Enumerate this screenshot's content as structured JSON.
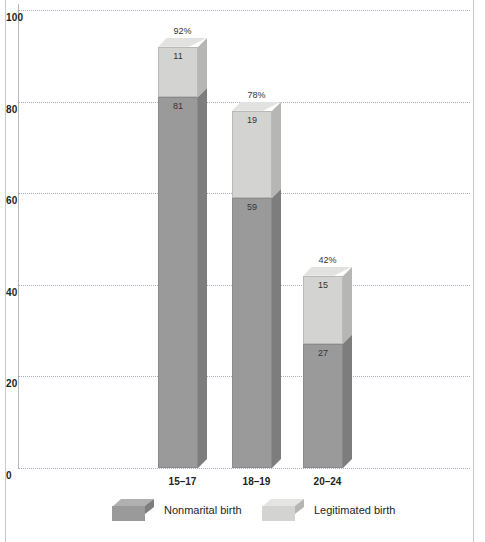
{
  "chart_data": {
    "type": "bar",
    "subtype": "stacked-3d-column",
    "title": "",
    "xlabel": "",
    "ylabel": "",
    "ylim": [
      0,
      100
    ],
    "yticks": [
      "0",
      "20",
      "40",
      "60",
      "80",
      "100"
    ],
    "grid": true,
    "legend_position": "bottom",
    "categories": [
      "15–17",
      "18–19",
      "20–24"
    ],
    "series": [
      {
        "name": "Nonmarital birth",
        "color": "#9a9a9a",
        "values": [
          81,
          59,
          27
        ]
      },
      {
        "name": "Legitimated birth",
        "color": "#d3d3d1",
        "values": [
          11,
          19,
          15
        ]
      }
    ],
    "totals": [
      "92%",
      "78%",
      "42%"
    ],
    "bars": [
      {
        "category": "15–17",
        "total_label": "92%",
        "total_value": 92,
        "dark_value": 81,
        "dark_label": "81",
        "light_value": 11,
        "light_label": "11"
      },
      {
        "category": "18–19",
        "total_label": "78%",
        "total_value": 78,
        "dark_value": 59,
        "dark_label": "59",
        "light_value": 19,
        "light_label": "19"
      },
      {
        "category": "20–24",
        "total_label": "42%",
        "total_value": 42,
        "dark_value": 27,
        "dark_label": "27",
        "light_value": 15,
        "light_label": "15"
      }
    ]
  },
  "axis": {
    "y": {
      "ticks": [
        {
          "label": "100",
          "value": 100
        },
        {
          "label": "80",
          "value": 80
        },
        {
          "label": "60",
          "value": 60
        },
        {
          "label": "40",
          "value": 40
        },
        {
          "label": "20",
          "value": 20
        },
        {
          "label": "0",
          "value": 0
        }
      ]
    }
  },
  "legend": {
    "items": [
      {
        "label": "Nonmarital birth",
        "swatch": "dark-gray-cube"
      },
      {
        "label": "Legitimated birth",
        "swatch": "light-gray-cube"
      }
    ]
  },
  "colors": {
    "dark_front": "#9a9a9a",
    "dark_side": "#7d7d7d",
    "dark_top": "#adadad",
    "light_front": "#d3d3d1",
    "light_side": "#b6b6b4",
    "light_top": "#e2e2e0",
    "gridline": "#9aa3b0",
    "axis": "#b9b9b9",
    "text": "#231f20",
    "background": "#ffffff"
  }
}
